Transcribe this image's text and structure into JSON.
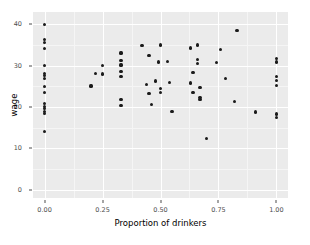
{
  "chart_data": {
    "type": "scatter",
    "title": "",
    "xlabel": "Proportion of drinkers",
    "ylabel": "wage",
    "xlim": [
      -0.05,
      1.05
    ],
    "ylim": [
      -2.0,
      43.0
    ],
    "xticks": [
      0.0,
      0.25,
      0.5,
      0.75,
      1.0
    ],
    "xticklabels": [
      "0.00",
      "0.25",
      "0.50",
      "0.75",
      "1.00"
    ],
    "yticks": [
      0,
      10,
      20,
      30,
      40
    ],
    "yticklabels": [
      "0",
      "10",
      "20",
      "30",
      "40"
    ],
    "grid": true,
    "grid_color": "#ffffff",
    "panel_background": "#ebebeb",
    "point_color": "#1a1a1a",
    "legend": "none",
    "points": [
      {
        "x": 0.0,
        "y": 40.0
      },
      {
        "x": 0.0,
        "y": 36.3
      },
      {
        "x": 0.0,
        "y": 35.6
      },
      {
        "x": 0.0,
        "y": 34.2
      },
      {
        "x": 0.0,
        "y": 30.0
      },
      {
        "x": 0.0,
        "y": 28.2
      },
      {
        "x": 0.0,
        "y": 27.6
      },
      {
        "x": 0.0,
        "y": 26.9
      },
      {
        "x": 0.0,
        "y": 25.0
      },
      {
        "x": 0.0,
        "y": 23.6
      },
      {
        "x": 0.0,
        "y": 20.8
      },
      {
        "x": 0.0,
        "y": 20.2
      },
      {
        "x": 0.0,
        "y": 19.6
      },
      {
        "x": 0.0,
        "y": 19.0
      },
      {
        "x": 0.0,
        "y": 18.4
      },
      {
        "x": 0.0,
        "y": 14.0
      },
      {
        "x": 0.2,
        "y": 25.1
      },
      {
        "x": 0.22,
        "y": 28.1
      },
      {
        "x": 0.25,
        "y": 30.0
      },
      {
        "x": 0.25,
        "y": 28.0
      },
      {
        "x": 0.33,
        "y": 33.1
      },
      {
        "x": 0.33,
        "y": 31.3
      },
      {
        "x": 0.33,
        "y": 30.2
      },
      {
        "x": 0.33,
        "y": 28.6
      },
      {
        "x": 0.33,
        "y": 27.4
      },
      {
        "x": 0.33,
        "y": 21.8
      },
      {
        "x": 0.33,
        "y": 20.3
      },
      {
        "x": 0.42,
        "y": 34.9
      },
      {
        "x": 0.45,
        "y": 32.4
      },
      {
        "x": 0.44,
        "y": 25.5
      },
      {
        "x": 0.45,
        "y": 23.3
      },
      {
        "x": 0.46,
        "y": 20.7
      },
      {
        "x": 0.48,
        "y": 26.3
      },
      {
        "x": 0.5,
        "y": 35.0
      },
      {
        "x": 0.49,
        "y": 30.9
      },
      {
        "x": 0.5,
        "y": 24.4
      },
      {
        "x": 0.5,
        "y": 23.6
      },
      {
        "x": 0.53,
        "y": 31.0
      },
      {
        "x": 0.54,
        "y": 25.9
      },
      {
        "x": 0.55,
        "y": 18.9
      },
      {
        "x": 0.63,
        "y": 34.3
      },
      {
        "x": 0.64,
        "y": 28.4
      },
      {
        "x": 0.63,
        "y": 25.8
      },
      {
        "x": 0.64,
        "y": 23.6
      },
      {
        "x": 0.66,
        "y": 35.0
      },
      {
        "x": 0.66,
        "y": 31.6
      },
      {
        "x": 0.66,
        "y": 30.5
      },
      {
        "x": 0.67,
        "y": 24.7
      },
      {
        "x": 0.67,
        "y": 22.4
      },
      {
        "x": 0.67,
        "y": 21.9
      },
      {
        "x": 0.7,
        "y": 12.4
      },
      {
        "x": 0.74,
        "y": 30.8
      },
      {
        "x": 0.76,
        "y": 33.9
      },
      {
        "x": 0.78,
        "y": 26.9
      },
      {
        "x": 0.83,
        "y": 38.5
      },
      {
        "x": 0.82,
        "y": 21.4
      },
      {
        "x": 0.91,
        "y": 18.8
      },
      {
        "x": 1.0,
        "y": 31.8
      },
      {
        "x": 1.0,
        "y": 30.9
      },
      {
        "x": 1.0,
        "y": 27.3
      },
      {
        "x": 1.0,
        "y": 26.5
      },
      {
        "x": 1.0,
        "y": 25.3
      },
      {
        "x": 1.0,
        "y": 18.3
      },
      {
        "x": 1.0,
        "y": 17.5
      }
    ]
  }
}
